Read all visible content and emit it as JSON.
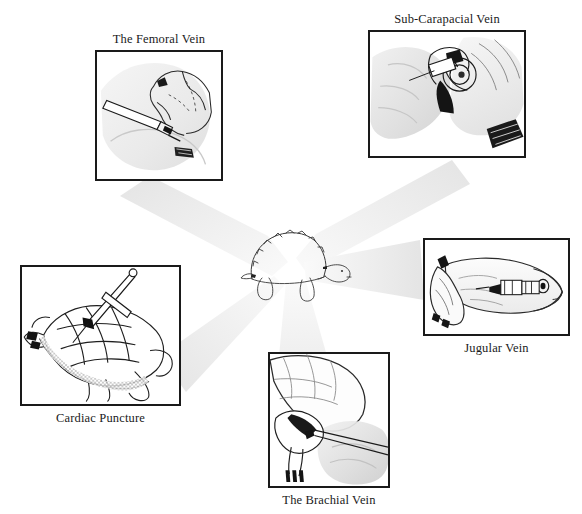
{
  "figure": {
    "background_color": "#ffffff",
    "ink_color": "#1a1a1a",
    "ray_color": "#ededed",
    "width": 582,
    "height": 514
  },
  "center": {
    "name": "tortoise",
    "caption": "",
    "description": "line drawing of a tortoise in side view facing right"
  },
  "panels": [
    {
      "id": "femoral",
      "label": "The Femoral Vein",
      "label_position": "above",
      "box": {
        "x": 95,
        "y": 50,
        "w": 128,
        "h": 131
      },
      "illustration": "hand holding tortoise hind leg with needle inserted at femoral site"
    },
    {
      "id": "sub-carapacial",
      "label": "Sub-Carapacial Vein",
      "label_position": "above",
      "box": {
        "x": 368,
        "y": 30,
        "w": 158,
        "h": 128
      },
      "illustration": "two hands holding tortoise, needle entering above neck beneath carapace"
    },
    {
      "id": "jugular",
      "label": "Jugular Vein",
      "label_position": "below",
      "box": {
        "x": 423,
        "y": 238,
        "w": 147,
        "h": 98
      },
      "illustration": "tortoise head and neck extended with needle in lateral neck"
    },
    {
      "id": "brachial",
      "label": "The Brachial Vein",
      "label_position": "below",
      "box": {
        "x": 268,
        "y": 352,
        "w": 122,
        "h": 136
      },
      "illustration": "hand holding tortoise front leg with needle at elbow"
    },
    {
      "id": "cardiac",
      "label": "Cardiac Puncture",
      "label_position": "below",
      "box": {
        "x": 20,
        "y": 265,
        "w": 161,
        "h": 141
      },
      "illustration": "tortoise on its back with long needle through plastron into heart"
    }
  ]
}
